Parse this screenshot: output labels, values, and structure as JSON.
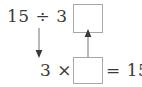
{
  "diagram": {
    "background_color": "#ffffff",
    "text_color": "#3a3a3a",
    "box_border_color": "#a8a8a8",
    "arrow_color": "#8a8a8a",
    "equations": {
      "division": {
        "text": "15 ÷ 3 =",
        "dividend": "15",
        "divisor": "3",
        "operator": "÷",
        "equals": "=",
        "answer_box_value": ""
      },
      "multiplication": {
        "left_text": "3 ×",
        "multiplier": "3",
        "operator": "×",
        "right_text": "= 15",
        "equals": "=",
        "product": "15",
        "answer_box_value": ""
      }
    },
    "arrows": [
      {
        "name": "down-arrow",
        "direction": "down",
        "from": "division-expression",
        "to": "multiplication-expression"
      },
      {
        "name": "up-arrow",
        "direction": "up",
        "from": "multiplication-answer-box",
        "to": "division-answer-box"
      }
    ]
  }
}
